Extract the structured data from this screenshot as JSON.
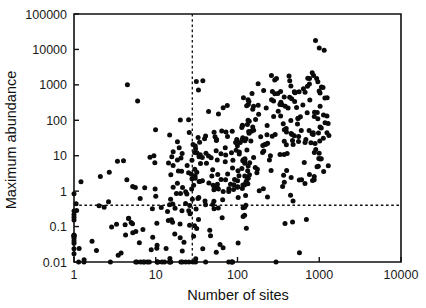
{
  "figure": {
    "title": "",
    "background": "#ffffff",
    "point_color": "#0b0b0b",
    "axis_color": "#111111"
  },
  "chart_data": {
    "type": "scatter",
    "title": "",
    "subtitle": "",
    "xlabel": "Number of sites",
    "ylabel": "Maximum abundance",
    "xscale": "log",
    "yscale": "log",
    "xlim": [
      1,
      10000
    ],
    "ylim": [
      0.01,
      100000
    ],
    "xticks": [
      1,
      10,
      100,
      1000,
      10000
    ],
    "xticklabels": [
      "1",
      "10",
      "100",
      "1000",
      "10000"
    ],
    "yticks": [
      0.01,
      0.1,
      1,
      10,
      100,
      1000,
      10000,
      100000
    ],
    "yticklabels": [
      "0.01",
      "0.1",
      "1",
      "10",
      "100",
      "1000",
      "10000",
      "100000"
    ],
    "grid": false,
    "legend": null,
    "marker": "circle-filled",
    "marker_size_px": 5.0,
    "annotations": [
      {
        "name": "vertical-threshold",
        "type": "vline",
        "x": 28,
        "style": "dashed",
        "label": ""
      },
      {
        "name": "horizontal-threshold",
        "type": "hline",
        "y": 0.4,
        "style": "dashed",
        "label": ""
      }
    ],
    "n_points": 436,
    "point_generation": {
      "method": "seeded-deterministic",
      "seed": 20240517,
      "description": "Occupancy-abundance cloud: log10(sites) in [0,3.12], log10(abundance) rising with sites, censored at 0.01 floor.",
      "clusters": [
        {
          "name": "left-sparse",
          "n": 46,
          "x_log_range": [
            0.0,
            1.15
          ],
          "y_log_center": -0.35,
          "y_log_spread": 0.95
        },
        {
          "name": "mid-dense",
          "n": 180,
          "x_log_range": [
            1.15,
            2.15
          ],
          "y_log_center": 0.35,
          "y_log_spread": 1.05
        },
        {
          "name": "right-dense",
          "n": 160,
          "x_log_range": [
            2.05,
            3.12
          ],
          "y_log_center": 0.95,
          "y_log_spread": 1.05
        },
        {
          "name": "upper-tail",
          "n": 16,
          "x_log_range": [
            2.35,
            3.1
          ],
          "y_log_center": 2.55,
          "y_log_spread": 0.7
        },
        {
          "name": "floor-row",
          "n": 22,
          "x_log_range": [
            0.7,
            1.95
          ],
          "y_log_center": -2.0,
          "y_log_spread": 0.0
        },
        {
          "name": "axis-edge",
          "n": 12,
          "x_log_range": [
            0.0,
            0.0
          ],
          "y_log_center": -0.4,
          "y_log_spread": 0.55
        }
      ],
      "explicit_points": [
        [
          1,
          0.85
        ],
        [
          1,
          0.22
        ],
        [
          2.1,
          2.6
        ],
        [
          2.7,
          3.4
        ],
        [
          3.4,
          7.0
        ],
        [
          4.5,
          1000
        ],
        [
          5.0,
          0.13
        ],
        [
          5.2,
          0.12
        ],
        [
          6.0,
          350
        ],
        [
          6.3,
          0.035
        ],
        [
          8.5,
          9.0
        ],
        [
          9.5,
          10.0
        ],
        [
          900,
          18000
        ],
        [
          1000,
          11000
        ],
        [
          1150,
          9500
        ],
        [
          820,
          2200
        ],
        [
          760,
          1500
        ],
        [
          1250,
          430
        ]
      ]
    }
  },
  "axes": {
    "x_axis": {
      "name": "x-axis",
      "label": "Number of sites",
      "ticks": [
        "1",
        "10",
        "100",
        "1000",
        "10000"
      ]
    },
    "y_axis": {
      "name": "y-axis",
      "label": "Maximum abundance",
      "ticks": [
        "0.01",
        "0.1",
        "1",
        "10",
        "100",
        "1000",
        "10000",
        "100000"
      ]
    }
  }
}
